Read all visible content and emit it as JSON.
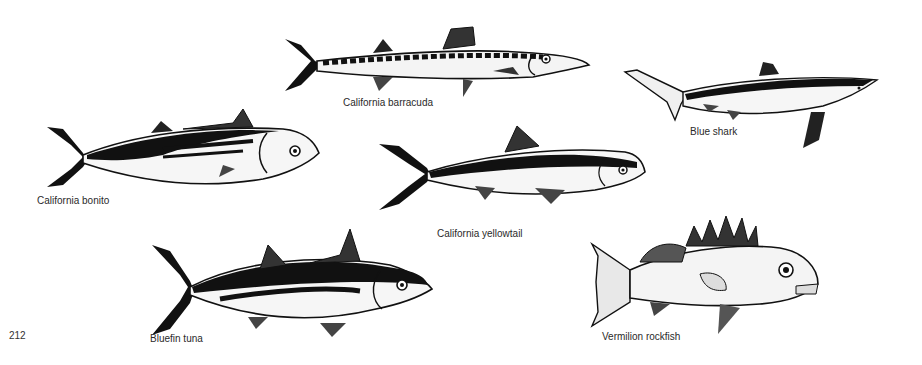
{
  "page": {
    "page_number": "212",
    "background": "#ffffff",
    "ink_color": "#111111"
  },
  "figures": [
    {
      "id": "barracuda",
      "label": "California barracuda",
      "icon": "barracuda-illustration"
    },
    {
      "id": "blue_shark",
      "label": "Blue shark",
      "icon": "shark-illustration"
    },
    {
      "id": "bonito",
      "label": "California bonito",
      "icon": "bonito-illustration"
    },
    {
      "id": "yellowtail",
      "label": "California yellowtail",
      "icon": "yellowtail-illustration"
    },
    {
      "id": "bluefin_tuna",
      "label": "Bluefin tuna",
      "icon": "tuna-illustration"
    },
    {
      "id": "vermilion_rockfish",
      "label": "Vermilion rockfish",
      "icon": "rockfish-illustration"
    }
  ]
}
